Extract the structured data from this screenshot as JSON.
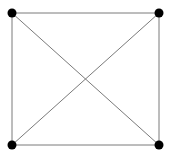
{
  "diagram": {
    "type": "complete-graph-K4",
    "colors": {
      "edge": "#7a7a7a",
      "node": "#000000",
      "background": "#ffffff"
    },
    "nodes": [
      {
        "id": "top-left",
        "x": 12,
        "y": 13
      },
      {
        "id": "top-right",
        "x": 159,
        "y": 13
      },
      {
        "id": "bottom-left",
        "x": 12,
        "y": 145
      },
      {
        "id": "bottom-right",
        "x": 159,
        "y": 145
      }
    ],
    "edges": [
      [
        "top-left",
        "top-right"
      ],
      [
        "top-left",
        "bottom-left"
      ],
      [
        "top-right",
        "bottom-right"
      ],
      [
        "bottom-left",
        "bottom-right"
      ],
      [
        "top-left",
        "bottom-right"
      ],
      [
        "top-right",
        "bottom-left"
      ]
    ]
  }
}
